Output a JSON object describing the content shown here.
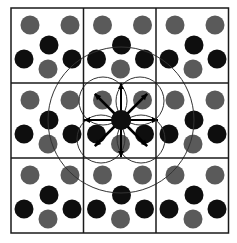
{
  "diagram": {
    "type": "crystal-lattice-supercell",
    "grid": {
      "cols": 3,
      "rows": 3,
      "x0": 11,
      "y0": 8,
      "cell_w": 72.5,
      "cell_h": 75
    },
    "colors": {
      "background": "#ffffff",
      "grid_line": "#1a1a1a",
      "atom_gray": "#5a5a5a",
      "atom_black": "#0e0e0e",
      "circle_line": "#333333",
      "arrow": "#000000"
    },
    "atom_radius": 9.5,
    "cell_pattern": [
      {
        "kind": "gray",
        "dx": 19,
        "dy": 17
      },
      {
        "kind": "gray",
        "dx": 59,
        "dy": 17
      },
      {
        "kind": "black",
        "dx": 38,
        "dy": 37
      },
      {
        "kind": "black",
        "dx": 13,
        "dy": 51
      },
      {
        "kind": "black",
        "dx": 61,
        "dy": 51
      },
      {
        "kind": "gray",
        "dx": 37,
        "dy": 61
      }
    ],
    "central_atom": {
      "x": 121,
      "y": 120
    },
    "large_circle": {
      "cx": 121,
      "cy": 120,
      "r": 73
    },
    "center_arrows": {
      "count": 8,
      "length": 37
    },
    "neighbor_circles": [
      {
        "cx": 103,
        "cy": 101,
        "r": 24
      },
      {
        "cx": 140,
        "cy": 101,
        "r": 24
      },
      {
        "cx": 101,
        "cy": 139,
        "r": 24
      },
      {
        "cx": 141,
        "cy": 139,
        "r": 24
      }
    ]
  }
}
